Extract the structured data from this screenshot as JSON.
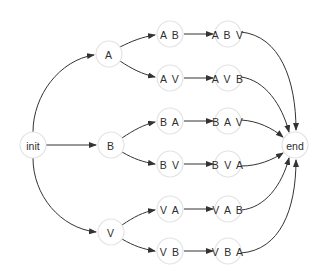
{
  "diagram": {
    "type": "state-transition-graph",
    "node_radius": 13,
    "colors": {
      "node_stroke": "#e3e3e3",
      "node_fill": "#ffffff",
      "edge": "#333333",
      "label": "#2e2e2e"
    },
    "nodes": [
      {
        "id": "init",
        "label": "init",
        "x": 33,
        "y": 145
      },
      {
        "id": "A",
        "label": "A",
        "x": 109,
        "y": 54
      },
      {
        "id": "B",
        "label": "B",
        "x": 111,
        "y": 145
      },
      {
        "id": "V",
        "label": "V",
        "x": 111,
        "y": 232
      },
      {
        "id": "AB",
        "label": "A B",
        "x": 170,
        "y": 34
      },
      {
        "id": "AV",
        "label": "A V",
        "x": 170,
        "y": 78
      },
      {
        "id": "BA",
        "label": "B A",
        "x": 170,
        "y": 121
      },
      {
        "id": "BV",
        "label": "B V",
        "x": 170,
        "y": 164
      },
      {
        "id": "VA",
        "label": "V A",
        "x": 170,
        "y": 209
      },
      {
        "id": "VB",
        "label": "V B",
        "x": 170,
        "y": 251
      },
      {
        "id": "ABV",
        "label": "A B V",
        "x": 228,
        "y": 34
      },
      {
        "id": "AVB",
        "label": "A V B",
        "x": 228,
        "y": 78
      },
      {
        "id": "BAV",
        "label": "B A V",
        "x": 228,
        "y": 121
      },
      {
        "id": "BVA",
        "label": "B V A",
        "x": 228,
        "y": 164
      },
      {
        "id": "VAB",
        "label": "V A B",
        "x": 228,
        "y": 209
      },
      {
        "id": "VBA",
        "label": "V B A",
        "x": 228,
        "y": 251
      },
      {
        "id": "end",
        "label": "end",
        "x": 295,
        "y": 145
      }
    ],
    "edges": [
      {
        "from": "init",
        "to": "A",
        "path": "M33,132 C33,95 60,60 94,55"
      },
      {
        "from": "init",
        "to": "B",
        "path": "M46,145 L96,145"
      },
      {
        "from": "init",
        "to": "V",
        "path": "M33,158 C33,195 60,228 96,232"
      },
      {
        "from": "A",
        "to": "AB",
        "path": "M120,47 C132,41 142,37 155,35"
      },
      {
        "from": "A",
        "to": "AV",
        "path": "M120,61 C132,69 142,74 155,77"
      },
      {
        "from": "B",
        "to": "BA",
        "path": "M122,138 C134,130 143,125 155,122"
      },
      {
        "from": "B",
        "to": "BV",
        "path": "M122,152 C134,159 143,162 155,164"
      },
      {
        "from": "V",
        "to": "VA",
        "path": "M122,225 C134,217 143,212 155,210"
      },
      {
        "from": "V",
        "to": "VB",
        "path": "M122,239 C134,246 143,249 155,251"
      },
      {
        "from": "AB",
        "to": "ABV",
        "path": "M184,34 L213,34"
      },
      {
        "from": "AV",
        "to": "AVB",
        "path": "M184,78 L213,78"
      },
      {
        "from": "BA",
        "to": "BAV",
        "path": "M184,121 L213,121"
      },
      {
        "from": "BV",
        "to": "BVA",
        "path": "M184,164 L213,164"
      },
      {
        "from": "VA",
        "to": "VAB",
        "path": "M184,209 L213,209"
      },
      {
        "from": "VB",
        "to": "VBA",
        "path": "M184,251 L213,251"
      },
      {
        "from": "ABV",
        "to": "end",
        "path": "M241,32 C280,36 296,80 296,130"
      },
      {
        "from": "AVB",
        "to": "end",
        "path": "M241,77 C265,80 282,105 289,132"
      },
      {
        "from": "BAV",
        "to": "end",
        "path": "M241,120 C258,121 272,128 283,137"
      },
      {
        "from": "BVA",
        "to": "end",
        "path": "M241,166 C258,166 272,160 283,153"
      },
      {
        "from": "VAB",
        "to": "end",
        "path": "M241,210 C265,208 282,185 289,158"
      },
      {
        "from": "VBA",
        "to": "end",
        "path": "M241,253 C280,250 296,210 296,160"
      }
    ]
  }
}
